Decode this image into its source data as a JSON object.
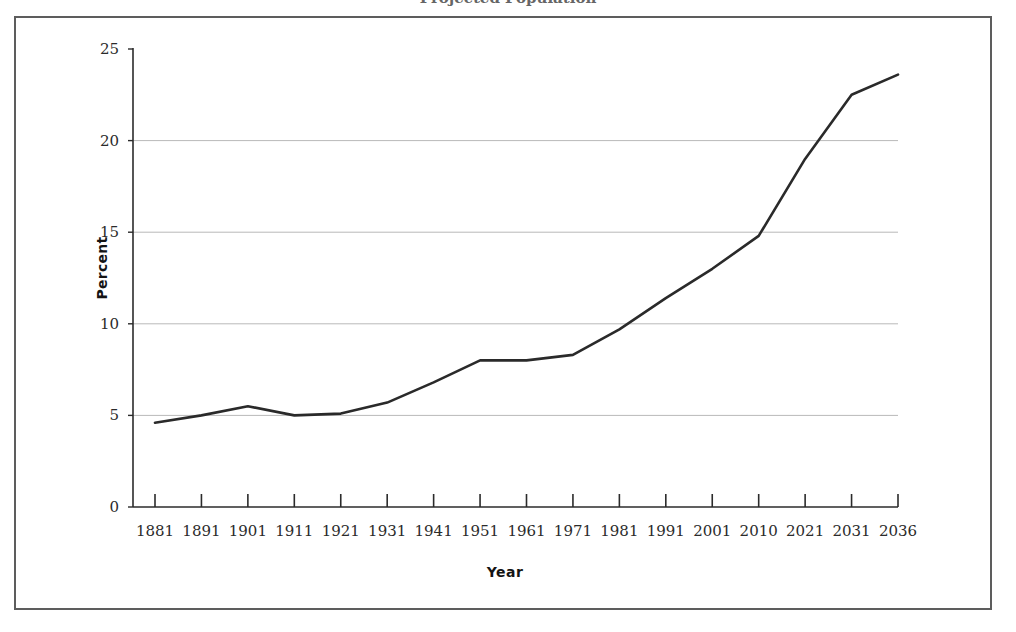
{
  "figure": {
    "title_fragment": "Projected Population",
    "frame_color": "#5d5d5d",
    "line_color": "#2a2a2a",
    "grid_color": "#b9b9b9"
  },
  "chart_data": {
    "type": "line",
    "title": "",
    "xlabel": "Year",
    "ylabel": "Percent",
    "categories": [
      "1881",
      "1891",
      "1901",
      "1911",
      "1921",
      "1931",
      "1941",
      "1951",
      "1961",
      "1971",
      "1981",
      "1991",
      "2001",
      "2010",
      "2021",
      "2031",
      "2036"
    ],
    "values": [
      4.6,
      5.0,
      5.5,
      5.0,
      5.1,
      5.7,
      6.8,
      8.0,
      8.0,
      8.3,
      9.7,
      11.4,
      13.0,
      14.8,
      19.0,
      22.5,
      23.6
    ],
    "series": [
      {
        "name": "Percent",
        "values": [
          4.6,
          5.0,
          5.5,
          5.0,
          5.1,
          5.7,
          6.8,
          8.0,
          8.0,
          8.3,
          9.7,
          11.4,
          13.0,
          14.8,
          19.0,
          22.5,
          23.6
        ]
      }
    ],
    "ylim": [
      0,
      25
    ],
    "yticks": [
      0,
      5,
      10,
      15,
      20,
      25
    ],
    "ytick_labels": [
      "0",
      "5",
      "10",
      "15",
      "20",
      "25"
    ],
    "grid": "horizontal",
    "legend": "none"
  }
}
